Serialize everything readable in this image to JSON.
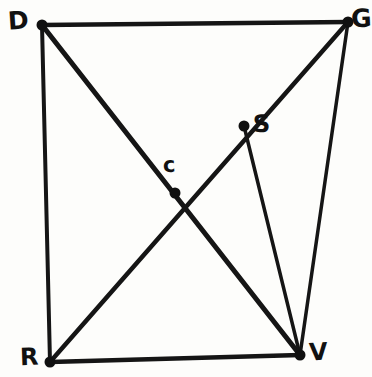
{
  "figure": {
    "background_color": "#fdfdfb",
    "ink_color": "#151515",
    "width": 364,
    "height": 377,
    "points": [
      {
        "id": "D",
        "label": "D",
        "x": 42,
        "y": 25,
        "kind": "corner"
      },
      {
        "id": "G",
        "label": "G",
        "x": 348,
        "y": 22,
        "kind": "corner"
      },
      {
        "id": "S",
        "label": "S",
        "x": 244,
        "y": 126,
        "kind": "on-diagonal"
      },
      {
        "id": "c",
        "label": "c",
        "x": 175,
        "y": 193,
        "kind": "intersection"
      },
      {
        "id": "R",
        "label": "R",
        "x": 50,
        "y": 362,
        "kind": "corner"
      },
      {
        "id": "V",
        "label": "V",
        "x": 300,
        "y": 355,
        "kind": "corner"
      }
    ],
    "edges": [
      {
        "id": "DG",
        "from": "D",
        "to": "G",
        "width": 4.5
      },
      {
        "id": "DR",
        "from": "D",
        "to": "R",
        "width": 4.0
      },
      {
        "id": "RV",
        "from": "R",
        "to": "V",
        "width": 4.5
      },
      {
        "id": "GV",
        "from": "G",
        "to": "V",
        "width": 3.5
      },
      {
        "id": "DV",
        "from": "D",
        "to": "V",
        "width": 5.0
      },
      {
        "id": "RG",
        "from": "R",
        "to": "G",
        "width": 4.5
      },
      {
        "id": "SV",
        "from": "S",
        "to": "V",
        "width": 3.5
      }
    ],
    "dot_radius": 5.5
  }
}
